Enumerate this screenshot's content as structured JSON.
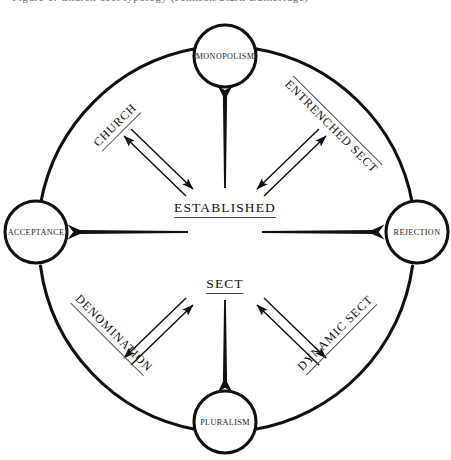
{
  "diagram": {
    "title_sliver": "Figure 1. Church-sect typology (Johnson/Stark-Bainbridge)",
    "type": "cyclic-typology-diagram",
    "colors": {
      "stroke": "#111111",
      "text": "#111111",
      "underline": "#555555",
      "background": "#ffffff"
    },
    "axes": {
      "vertical": {
        "top_pole": "MONOPOLISM",
        "bottom_pole": "PLURALISM"
      },
      "horizontal": {
        "left_pole": "ACCEPTANCE",
        "right_pole": "REJECTION"
      }
    },
    "nodes": [
      {
        "id": "monopolism",
        "label": "MONOPOLISM",
        "position": "top",
        "cx": 225,
        "cy": 56,
        "r": 31
      },
      {
        "id": "rejection",
        "label": "REJECTION",
        "position": "right",
        "cx": 417,
        "cy": 232,
        "r": 31
      },
      {
        "id": "pluralism",
        "label": "PLURALISM",
        "position": "bottom",
        "cx": 225,
        "cy": 422,
        "r": 31
      },
      {
        "id": "acceptance",
        "label": "ACCEPTANCE",
        "position": "left",
        "cx": 36,
        "cy": 232,
        "r": 31
      }
    ],
    "center_labels": [
      {
        "id": "established",
        "label": "ESTABLISHED",
        "underlined": true,
        "x": 225,
        "y": 209
      },
      {
        "id": "sect",
        "label": "SECT",
        "underlined": true,
        "x": 225,
        "y": 285
      }
    ],
    "quadrant_labels": [
      {
        "id": "church",
        "label": "CHURCH",
        "quadrant": "top-left",
        "rotation": -45,
        "rule": "under",
        "x": 116,
        "y": 126
      },
      {
        "id": "entrenched-sect",
        "label": "ENTRENCHED SECT",
        "quadrant": "top-right",
        "rotation": 45,
        "rule": "over",
        "x": 332,
        "y": 126
      },
      {
        "id": "denomination",
        "label": "DENOMINATION",
        "quadrant": "bottom-left",
        "rotation": 45,
        "rule": "under",
        "x": 113,
        "y": 334
      },
      {
        "id": "dynamic-sect",
        "label": "DYNAMIC SECT",
        "quadrant": "bottom-right",
        "rotation": -45,
        "rule": "under",
        "x": 336,
        "y": 334
      }
    ],
    "connectors": [
      {
        "id": "axis-up",
        "kind": "tapered-arrow",
        "from": "center",
        "to": "monopolism",
        "direction": "up"
      },
      {
        "id": "axis-down",
        "kind": "tapered-arrow",
        "from": "center",
        "to": "pluralism",
        "direction": "down"
      },
      {
        "id": "axis-left",
        "kind": "tapered-arrow",
        "from": "center",
        "to": "acceptance",
        "direction": "left"
      },
      {
        "id": "axis-right",
        "kind": "tapered-arrow",
        "from": "center",
        "to": "rejection",
        "direction": "right"
      },
      {
        "id": "pair-top-left",
        "kind": "double-arrow-pair",
        "quadrant": "top-left"
      },
      {
        "id": "pair-top-right",
        "kind": "double-arrow-pair",
        "quadrant": "top-right"
      },
      {
        "id": "pair-bottom-left",
        "kind": "double-arrow-pair",
        "quadrant": "bottom-left"
      },
      {
        "id": "pair-bottom-right",
        "kind": "double-arrow-pair",
        "quadrant": "bottom-right"
      }
    ],
    "outer_ring": {
      "cx": 225,
      "cy": 239,
      "r": 192,
      "stroke_width": 3
    }
  }
}
